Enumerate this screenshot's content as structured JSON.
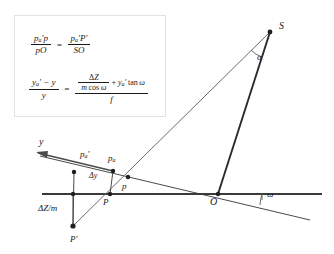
{
  "figure": {
    "type": "geometric-optics-diagram"
  },
  "formula_box": {
    "formula_1": {
      "lhs": {
        "numerator": "p'a p",
        "denominator": "pO"
      },
      "relation": "=",
      "rhs": {
        "numerator": "p'a P'",
        "denominator": "SO"
      },
      "plain": "(p'a·p)/(p·O) = (p'a·P')/(S·O)"
    },
    "formula_2": {
      "lhs": {
        "numerator": "y'a - y",
        "denominator": "y"
      },
      "relation": "=",
      "rhs": {
        "numerator_fraction": {
          "numerator": "ΔZ",
          "denominator": "m cos ω"
        },
        "numerator_plus_term": "+ y'a tan ω",
        "denominator": "f"
      },
      "plain": "(y'a - y)/y = ( ΔZ/(m cos ω) + y'a tan ω ) / f"
    },
    "symbols": {
      "delta_Z": "ΔZ",
      "m_cos_omega": "m cos ω",
      "tan_omega": "tan ω",
      "f": "f",
      "y": "y",
      "y_a_prime": "y'a"
    }
  },
  "diagram": {
    "labels": {
      "S": "S",
      "alpha": "α",
      "omega": "ω",
      "y_axis": "y",
      "pa_prime": "p",
      "pa_prime_sub": "a",
      "pa": "p",
      "pa_sub": "a",
      "p_small": "p",
      "P_cap": "P",
      "O": "O",
      "delta_y": "Δy",
      "delta_Z_over_m": "ΔZ/m",
      "P_prime": "P′"
    },
    "points": {
      "S": {
        "x": 270,
        "y": 32,
        "marker": "dot"
      },
      "O": {
        "x": 218,
        "y": 194,
        "marker": "dot"
      },
      "P": {
        "x": 110,
        "y": 194,
        "marker": "dot"
      },
      "P_prime": {
        "x": 73,
        "y": 226,
        "marker": "dot"
      },
      "p_small": {
        "x": 128,
        "y": 177,
        "marker": "dot"
      },
      "pa": {
        "x": 113,
        "y": 171,
        "marker": "dot"
      },
      "pa_prime": {
        "x": 73,
        "y": 172,
        "marker": "dot"
      },
      "vertical_foot": {
        "x": 73,
        "y": 194,
        "marker": "dot"
      }
    },
    "lines": {
      "horizontal_axis": {
        "from": [
          42,
          194
        ],
        "to": [
          322,
          194
        ],
        "weight": "thick"
      },
      "tilted_axis": {
        "from": [
          40,
          156
        ],
        "to": [
          310,
          220
        ],
        "weight": "thin"
      },
      "ray_S_to_P_prime": {
        "from": [
          270,
          32
        ],
        "to": [
          73,
          226
        ],
        "weight": "thin"
      },
      "line_S_to_O": {
        "from": [
          270,
          32
        ],
        "to": [
          218,
          194
        ],
        "weight": "thick"
      },
      "segment_pa_prime_to_P_prime": {
        "from": [
          73,
          172
        ],
        "to": [
          73,
          226
        ]
      },
      "segment_pa_to_P": {
        "from": [
          113,
          171
        ],
        "to": [
          110,
          194
        ]
      },
      "segment_drop_dz": {
        "from": [
          73,
          194
        ],
        "to": [
          73,
          226
        ]
      }
    },
    "angles": {
      "alpha": {
        "vertex": "S",
        "value_text": "α"
      },
      "omega": {
        "vertex": "O",
        "value_text": "ω"
      }
    },
    "colors": {
      "stroke": "#3a3a3a",
      "stroke_thick": "#2b2b2b",
      "text": "#1a1a1a",
      "box_border": "#e3e3e3",
      "background": "#ffffff"
    }
  }
}
